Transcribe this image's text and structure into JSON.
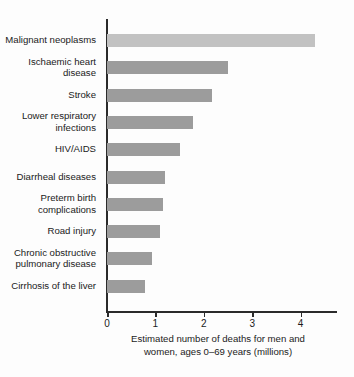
{
  "chart_data": {
    "type": "bar",
    "orientation": "horizontal",
    "title": "",
    "subtitle": "",
    "xlabel": "Estimated number of deaths for men and women, ages 0–69 years (millions)",
    "xlabel_line1": "Estimated number of deaths for men and",
    "xlabel_line2": "women, ages 0–69 years (millions)",
    "ylabel": "",
    "xlim": [
      0,
      4.75
    ],
    "xticks": [
      0,
      1,
      2,
      3,
      4
    ],
    "xtick_labels": [
      "0",
      "1",
      "2",
      "3",
      "4"
    ],
    "grid": false,
    "legend": "none",
    "categories": [
      "Malignant neoplasms",
      "Ischaemic heart disease",
      "Stroke",
      "Lower respiratory infections",
      "HIV/AIDS",
      "Diarrheal diseases",
      "Preterm birth complications",
      "Road injury",
      "Chronic obstructive pulmonary disease",
      "Cirrhosis of the liver"
    ],
    "category_labels_wrapped": [
      "Malignant neoplasms",
      "Ischaemic heart\ndisease",
      "Stroke",
      "Lower respiratory\ninfections",
      "HIV/AIDS",
      "Diarrheal diseases",
      "Preterm birth\ncomplications",
      "Road injury",
      "Chronic obstructive\npulmonary disease",
      "Cirrhosis of the liver"
    ],
    "values": [
      4.3,
      2.5,
      2.17,
      1.78,
      1.51,
      1.2,
      1.15,
      1.1,
      0.93,
      0.78
    ],
    "bar_colors": [
      "#c2c2c2",
      "#9c9c9c",
      "#9c9c9c",
      "#9c9c9c",
      "#9c9c9c",
      "#9c9c9c",
      "#9c9c9c",
      "#9c9c9c",
      "#9c9c9c",
      "#9c9c9c"
    ],
    "highlight_index": 0,
    "axis_color": "#2b2b2b",
    "background_color": "#fdfdfd",
    "text_color": "#1b1b1b"
  }
}
